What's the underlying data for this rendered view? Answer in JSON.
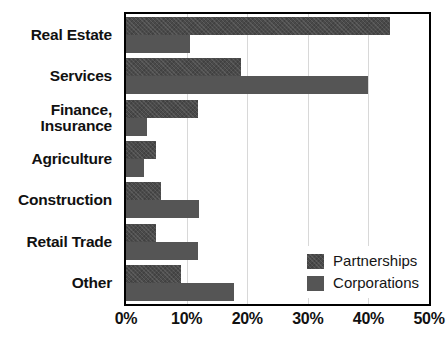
{
  "chart_data": {
    "type": "bar",
    "orientation": "horizontal",
    "title": "",
    "xlabel": "",
    "ylabel": "",
    "categories": [
      "Real Estate",
      "Services",
      "Finance,\nInsurance",
      "Agriculture",
      "Construction",
      "Retail Trade",
      "Other"
    ],
    "series": [
      {
        "name": "Partnerships",
        "values": [
          43.6,
          18.9,
          11.9,
          4.9,
          5.7,
          4.9,
          9.0
        ]
      },
      {
        "name": "Corporations",
        "values": [
          10.6,
          39.9,
          3.4,
          2.9,
          12.0,
          11.9,
          17.8
        ]
      }
    ],
    "xlim": [
      0,
      50
    ],
    "xtick_values": [
      0,
      10,
      20,
      30,
      40,
      50
    ],
    "xtick_labels": [
      "0%",
      "10%",
      "20%",
      "30%",
      "40%",
      "50%"
    ],
    "grid": true,
    "grid_axis": "x",
    "legend_position": "bottom-right",
    "colors": {
      "partnerships": "#4a4a4a",
      "corporations": "#555555",
      "gridline": "#d8d8d8",
      "frame": "#000000",
      "text": "#111111",
      "background": "#ffffff"
    }
  },
  "legend": {
    "items": [
      {
        "label": "Partnerships",
        "swatch": "partnerships"
      },
      {
        "label": "Corporations",
        "swatch": "corporations"
      }
    ]
  }
}
